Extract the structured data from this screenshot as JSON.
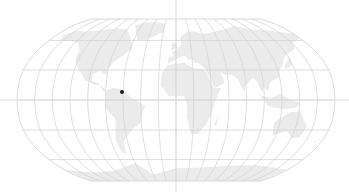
{
  "map": {
    "projection": "robinson",
    "width": 349,
    "height": 192,
    "center_x": 176,
    "equator_y": 100,
    "half_width": 159,
    "top_y": 15,
    "bottom_y": 177,
    "colors": {
      "background": "#ffffff",
      "land": "#ebebeb",
      "graticule": "#d2d2d2",
      "crosshair": "#d9d9d9",
      "marker": "#1a1a1a"
    },
    "graticule": {
      "meridian_step_deg": 20,
      "parallels_deg": [
        -60,
        -30,
        0,
        30,
        60
      ]
    },
    "crosshair": {
      "x": 176,
      "y": 100
    },
    "markers": [
      {
        "label": "location-marker",
        "x": 122,
        "y": 92
      }
    ]
  }
}
